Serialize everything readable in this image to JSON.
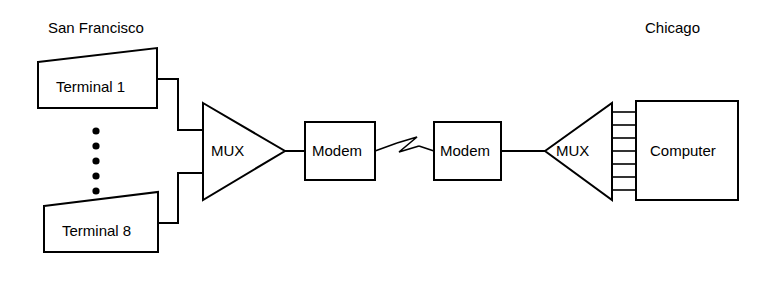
{
  "diagram": {
    "locations": {
      "left": "San Francisco",
      "right": "Chicago"
    },
    "nodes": {
      "terminal_top": "Terminal 1",
      "terminal_bottom": "Terminal 8",
      "mux_left": "MUX",
      "modem_left": "Modem",
      "modem_right": "Modem",
      "mux_right": "MUX",
      "computer": "Computer"
    },
    "ellipsis": {
      "dot_count": 5,
      "meaning": "additional terminals 2 through 7"
    },
    "computer_bus": {
      "line_count": 7
    },
    "link_symbol": "telephone-line-zigzag",
    "colors": {
      "stroke": "#000000",
      "fill": "#ffffff",
      "background": "#ffffff"
    }
  }
}
